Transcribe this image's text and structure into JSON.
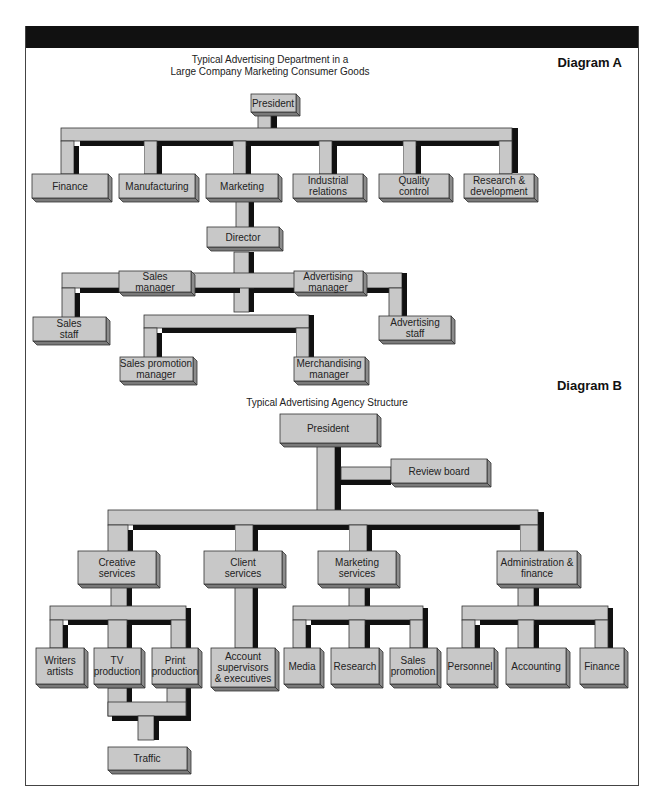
{
  "diagram_a": {
    "label": "Diagram A",
    "title_line1": "Typical Advertising Department in a",
    "title_line2": "Large Company Marketing Consumer Goods",
    "nodes": {
      "president": "President",
      "finance": "Finance",
      "manufacturing": "Manufacturing",
      "marketing": "Marketing",
      "industrial_1": "Industrial",
      "industrial_2": "relations",
      "quality_1": "Quality",
      "quality_2": "control",
      "research_1": "Research &",
      "research_2": "development",
      "director": "Director",
      "sales_mgr_1": "Sales",
      "sales_mgr_2": "manager",
      "adv_mgr_1": "Advertising",
      "adv_mgr_2": "manager",
      "sales_staff_1": "Sales",
      "sales_staff_2": "staff",
      "adv_staff_1": "Advertising",
      "adv_staff_2": "staff",
      "sales_promo_1": "Sales promotion",
      "sales_promo_2": "manager",
      "merch_1": "Merchandising",
      "merch_2": "manager"
    }
  },
  "diagram_b": {
    "label": "Diagram B",
    "title": "Typical Advertising Agency Structure",
    "nodes": {
      "president": "President",
      "review_board": "Review board",
      "creative_1": "Creative",
      "creative_2": "services",
      "client_1": "Client",
      "client_2": "services",
      "mkt_services_1": "Marketing",
      "mkt_services_2": "services",
      "admin_1": "Administration &",
      "admin_2": "finance",
      "writers_1": "Writers",
      "writers_2": "artists",
      "tv_1": "TV",
      "tv_2": "production",
      "print_1": "Print",
      "print_2": "production",
      "account_1": "Account",
      "account_2": "supervisors",
      "account_3": "& executives",
      "media": "Media",
      "research": "Research",
      "sales_promo_1": "Sales",
      "sales_promo_2": "promotion",
      "personnel": "Personnel",
      "accounting": "Accounting",
      "finance": "Finance",
      "traffic": "Traffic"
    }
  }
}
